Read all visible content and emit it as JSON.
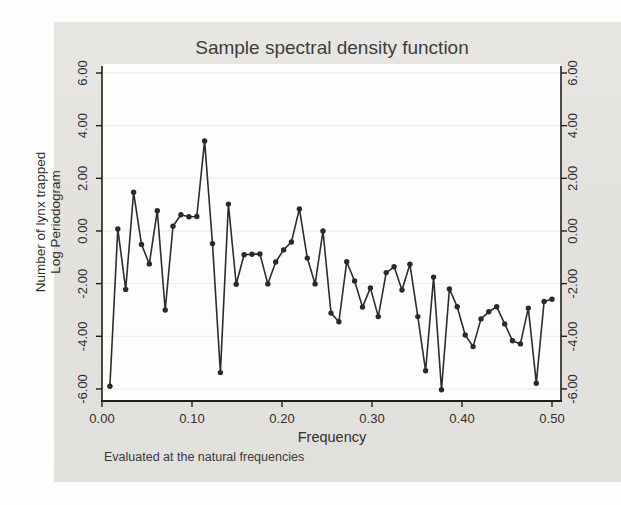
{
  "chart_data": {
    "type": "line",
    "title": "Sample spectral density function",
    "xlabel": "Frequency",
    "ylabel_line1": "Number of lynx trapped",
    "ylabel_line2": "Log Periodogram",
    "note": "Evaluated at the natural frequencies",
    "x_ticks": [
      "0.00",
      "0.10",
      "0.20",
      "0.30",
      "0.40",
      "0.50"
    ],
    "x_tick_values": [
      0,
      0.1,
      0.2,
      0.3,
      0.4,
      0.5
    ],
    "y_ticks": [
      "6.00",
      "4.00",
      "2.00",
      "0.00",
      "-2.00",
      "-4.00",
      "-6.00"
    ],
    "y_tick_values": [
      6,
      4,
      2,
      0,
      -2,
      -4,
      -6
    ],
    "xlim": [
      0,
      0.51
    ],
    "ylim": [
      -6.45,
      6.35
    ],
    "grid": true,
    "legend": "none",
    "marker": "filled-circle",
    "line_color": "#2d2d2d",
    "marker_color": "#2a2a2a",
    "grid_color": "#eaeae6",
    "axis_color": "#1f1f1f",
    "x": [
      0.0088,
      0.0175,
      0.0263,
      0.0351,
      0.0439,
      0.0526,
      0.0614,
      0.0702,
      0.0789,
      0.0877,
      0.0965,
      0.1053,
      0.114,
      0.1228,
      0.1316,
      0.1404,
      0.1491,
      0.1579,
      0.1667,
      0.1754,
      0.1842,
      0.193,
      0.2018,
      0.2105,
      0.2193,
      0.2281,
      0.2368,
      0.2456,
      0.2544,
      0.2632,
      0.2719,
      0.2807,
      0.2895,
      0.2982,
      0.307,
      0.3158,
      0.3246,
      0.3333,
      0.3421,
      0.3509,
      0.3596,
      0.3684,
      0.3772,
      0.386,
      0.3947,
      0.4035,
      0.4123,
      0.4211,
      0.4298,
      0.4386,
      0.4474,
      0.4561,
      0.4649,
      0.4737,
      0.4825,
      0.4912,
      0.5
    ],
    "y": [
      -5.9,
      0.08,
      -2.22,
      1.47,
      -0.51,
      -1.25,
      0.77,
      -3.0,
      0.18,
      0.62,
      0.54,
      0.55,
      3.42,
      -0.48,
      -5.38,
      1.02,
      -2.02,
      -0.9,
      -0.88,
      -0.87,
      -2.01,
      -1.18,
      -0.72,
      -0.42,
      0.84,
      -1.03,
      -2.01,
      0.0,
      -3.12,
      -3.45,
      -1.17,
      -1.9,
      -2.89,
      -2.16,
      -3.25,
      -1.58,
      -1.36,
      -2.24,
      -1.26,
      -3.25,
      -5.31,
      -1.75,
      -6.03,
      -2.2,
      -2.88,
      -3.95,
      -4.39,
      -3.34,
      -3.07,
      -2.88,
      -3.53,
      -4.17,
      -4.29,
      -2.93,
      -5.78,
      -2.68,
      -2.59
    ]
  }
}
